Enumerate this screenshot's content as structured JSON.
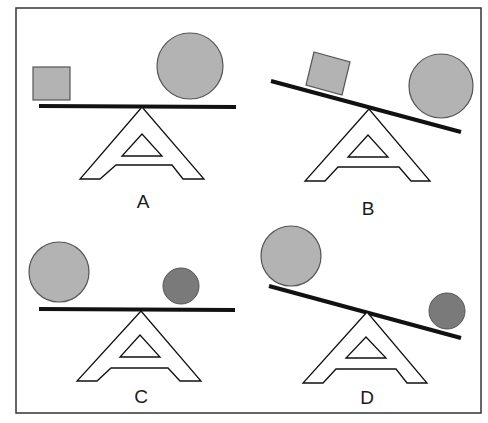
{
  "panels": [
    {
      "label": "A",
      "beam": "level",
      "left_object": "small square",
      "right_object": "large circle"
    },
    {
      "label": "B",
      "beam": "tilted down right",
      "left_object": "small square (tilted)",
      "right_object": "large circle"
    },
    {
      "label": "C",
      "beam": "level",
      "left_object": "large light circle",
      "right_object": "small dark circle"
    },
    {
      "label": "D",
      "beam": "tilted down right",
      "left_object": "large light circle",
      "right_object": "small dark circle"
    }
  ],
  "colors": {
    "light_gray": "#b3b3b3",
    "dark_gray": "#7a7a7a",
    "line": "#111111"
  }
}
